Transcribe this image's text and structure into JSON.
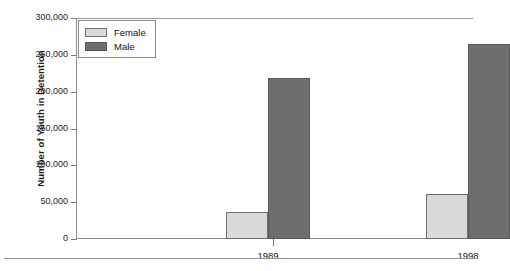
{
  "chart_data": {
    "type": "bar",
    "title": "",
    "xlabel": "",
    "ylabel": "Number of Youth in Detention",
    "categories": [
      "1989",
      "1998"
    ],
    "series": [
      {
        "name": "Female",
        "values": [
          37000,
          61000
        ],
        "color": "#d9d9d9"
      },
      {
        "name": "Male",
        "values": [
          218000,
          265000
        ],
        "color": "#6e6e6e"
      }
    ],
    "ylim": [
      0,
      300000
    ],
    "ytick_labels": [
      "0",
      "50,000",
      "100,000",
      "150,000",
      "200,000",
      "250,000",
      "300,000"
    ],
    "ytick_values": [
      0,
      50000,
      100000,
      150000,
      200000,
      250000,
      300000
    ],
    "grid": false,
    "legend_position": "top-left"
  },
  "legend": {
    "entries": [
      {
        "label": "Female",
        "swatch": "female"
      },
      {
        "label": "Male",
        "swatch": "male"
      }
    ]
  },
  "footer": {
    "caption": ""
  }
}
